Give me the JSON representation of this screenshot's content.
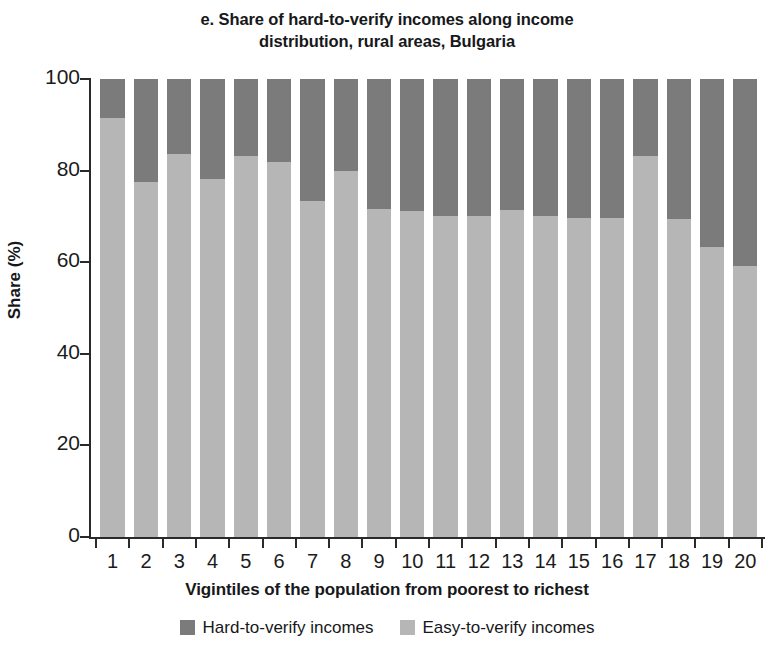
{
  "title": {
    "line1": "e. Share of hard-to-verify incomes along income",
    "line2": "distribution, rural areas, Bulgaria"
  },
  "colors": {
    "hard": "#7b7b7b",
    "easy": "#b6b6b6",
    "axis": "#2a2a2a",
    "text": "#17181a",
    "background": "#ffffff"
  },
  "legend": {
    "position": "bottom-center",
    "items": [
      {
        "label": "Hard-to-verify incomes",
        "color": "#7b7b7b",
        "swatch": "legend-swatch-hard"
      },
      {
        "label": "Easy-to-verify incomes",
        "color": "#b6b6b6",
        "swatch": "legend-swatch-easy"
      }
    ]
  },
  "chart_data": {
    "type": "bar",
    "subtype": "stacked-100-percent",
    "title": "e. Share of hard-to-verify incomes along income distribution, rural areas, Bulgaria",
    "xlabel": "Vigintiles of the population from poorest to richest",
    "ylabel": "Share (%)",
    "ylim": [
      0,
      100
    ],
    "yticks": [
      0,
      20,
      40,
      60,
      80,
      100
    ],
    "ytick_labels": [
      "0",
      "20",
      "40",
      "60",
      "80",
      "100"
    ],
    "grid": false,
    "categories": [
      "1",
      "2",
      "3",
      "4",
      "5",
      "6",
      "7",
      "8",
      "9",
      "10",
      "11",
      "12",
      "13",
      "14",
      "15",
      "16",
      "17",
      "18",
      "19",
      "20"
    ],
    "series": [
      {
        "name": "Easy-to-verify incomes",
        "color": "#b6b6b6",
        "values": [
          91.5,
          77.5,
          83.6,
          78.1,
          83.2,
          81.8,
          73.4,
          80.0,
          71.6,
          71.2,
          70.1,
          70.1,
          71.4,
          70.0,
          69.6,
          69.7,
          83.2,
          69.4,
          63.4,
          59.2
        ]
      },
      {
        "name": "Hard-to-verify incomes",
        "color": "#7b7b7b",
        "values": [
          8.5,
          22.5,
          16.4,
          21.9,
          16.8,
          18.2,
          26.6,
          20.0,
          28.4,
          28.8,
          29.9,
          29.9,
          28.6,
          30.0,
          30.4,
          30.3,
          16.8,
          30.6,
          36.6,
          40.8
        ]
      }
    ]
  }
}
